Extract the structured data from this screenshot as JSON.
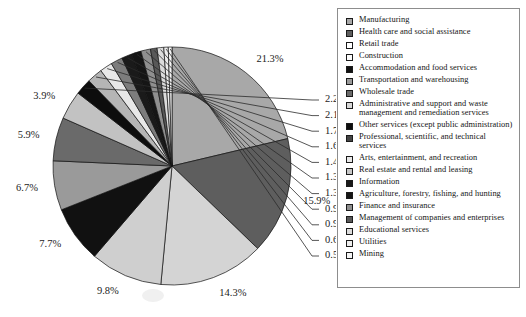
{
  "chart_data": {
    "type": "pie",
    "title": "",
    "start_angle_deg": 0,
    "direction": "clockwise",
    "legend_position": "right",
    "grid": false,
    "categories": [
      "Manufacturing",
      "Health care and social assistance",
      "Retail trade",
      "Construction",
      "Accommodation and food services",
      "Transportation and warehousing",
      "Wholesale trade",
      "Administrative and support and waste management and remediation services",
      "Other services (except public administration)",
      "Professional, scientific, and technical services",
      "Arts, entertainment, and recreation",
      "Real estate and rental and leasing",
      "Information",
      "Agriculture, forestry, fishing, and hunting",
      "Finance and insurance",
      "Management of companies and enterprises",
      "Educational services",
      "Utilities",
      "Mining"
    ],
    "values": [
      21.3,
      15.9,
      14.3,
      9.8,
      7.7,
      6.7,
      5.9,
      3.9,
      2.2,
      2.1,
      1.7,
      1.6,
      1.4,
      1.3,
      1.3,
      0.9,
      0.9,
      0.6,
      0.5
    ],
    "value_labels": [
      "21.3%",
      "15.9%",
      "14.3%",
      "9.8%",
      "7.7%",
      "6.7%",
      "5.9%",
      "3.9%",
      "2.2%",
      "2.1%",
      "1.7%",
      "1.6%",
      "1.4%",
      "1.3%",
      "1.3%",
      "0.9%",
      "0.9%",
      "0.6%",
      "0.5%"
    ],
    "colors": [
      "#a8a8a8",
      "#5e5e5e",
      "#d4d4d4",
      "#cfcfcf",
      "#111111",
      "#9a9a9a",
      "#6a6a6a",
      "#c2c2c2",
      "#0d0d0d",
      "#b5b5b5",
      "#e8e8e8",
      "#7d7d7d",
      "#1a1a1a",
      "#151515",
      "#8f8f8f",
      "#585858",
      "#dcdcdc",
      "#ededed",
      "#f4f4f4"
    ],
    "xlabel": "",
    "ylabel": ""
  },
  "legend": {
    "items": [
      {
        "label": "Manufacturing",
        "color": "#a8a8a8"
      },
      {
        "label": "Health care and social assistance",
        "color": "#5e5e5e"
      },
      {
        "label": "Retail trade",
        "color": "#ffffff"
      },
      {
        "label": "Construction",
        "color": "#fbfbfb"
      },
      {
        "label": "Accommodation and food services",
        "color": "#111111"
      },
      {
        "label": "Transportation and warehousing",
        "color": "#9a9a9a"
      },
      {
        "label": "Wholesale trade",
        "color": "#6a6a6a"
      },
      {
        "label": "Administrative and support and waste management and remediation services",
        "color": "#d8d8d8"
      },
      {
        "label": "Other services (except public administration)",
        "color": "#0d0d0d"
      },
      {
        "label": "Professional, scientific, and technical services",
        "color": "#454545"
      },
      {
        "label": "Arts, entertainment, and recreation",
        "color": "#e8e8e8"
      },
      {
        "label": "Real estate and rental and leasing",
        "color": "#c8c8c8"
      },
      {
        "label": "Information",
        "color": "#1a1a1a"
      },
      {
        "label": "Agriculture, forestry, fishing, and hunting",
        "color": "#151515"
      },
      {
        "label": "Finance and insurance",
        "color": "#8f8f8f"
      },
      {
        "label": "Management of companies and enterprises",
        "color": "#585858"
      },
      {
        "label": "Educational services",
        "color": "#dcdcdc"
      },
      {
        "label": "Utilities",
        "color": "#ededed"
      },
      {
        "label": "Mining",
        "color": "#f4f4f4"
      }
    ]
  },
  "caption": {
    "text": ""
  },
  "geometry": {
    "center_x": 172,
    "center_y": 166,
    "radius": 119
  }
}
